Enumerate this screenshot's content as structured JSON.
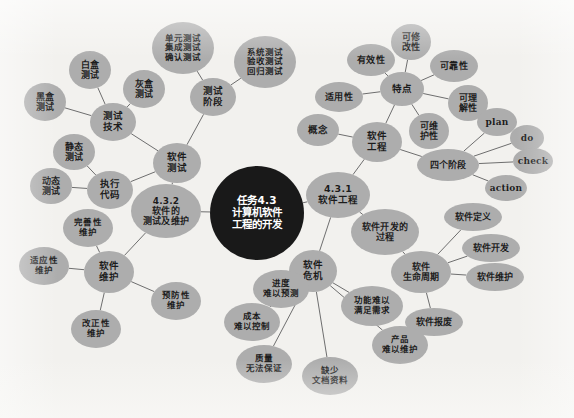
{
  "diagram": {
    "background_color": "#f2f1ee",
    "node_color": "#adadad",
    "center_node_color": "#191919",
    "edge_color": "#6e6e6e",
    "width": 574,
    "height": 418
  },
  "nodes": [
    {
      "id": "center",
      "label": "任务4.3\n计算机软件\n工程的开发",
      "x": 257,
      "y": 213,
      "rx": 47,
      "ry": 47,
      "font": 10.5,
      "kind": "center",
      "script": "cjk"
    },
    {
      "id": "n431",
      "label": "4.3.1\n软件工程",
      "x": 338,
      "y": 195,
      "rx": 32,
      "ry": 23,
      "font": 9.5,
      "kind": "branch",
      "script": "cjk"
    },
    {
      "id": "n432",
      "label": "4.3.2\n软件的\n测试及维护",
      "x": 166,
      "y": 211,
      "rx": 35,
      "ry": 27,
      "font": 9,
      "kind": "branch",
      "script": "cjk"
    },
    {
      "id": "ruanjiangongcheng",
      "label": "软件\n工程",
      "x": 377,
      "y": 142,
      "rx": 25,
      "ry": 20,
      "font": 9.5,
      "kind": "node",
      "script": "cjk"
    },
    {
      "id": "gainian",
      "label": "概念",
      "x": 318,
      "y": 130,
      "rx": 21,
      "ry": 16,
      "font": 9.5,
      "kind": "node",
      "script": "cjk"
    },
    {
      "id": "tedian",
      "label": "特点",
      "x": 402,
      "y": 89,
      "rx": 22,
      "ry": 17,
      "font": 9.5,
      "kind": "node",
      "script": "cjk"
    },
    {
      "id": "shiyongxing",
      "label": "适用性",
      "x": 339,
      "y": 97,
      "rx": 24,
      "ry": 15,
      "font": 9,
      "kind": "node",
      "script": "cjk"
    },
    {
      "id": "youxiaoxing",
      "label": "有效性",
      "x": 371,
      "y": 60,
      "rx": 24,
      "ry": 16,
      "font": 9,
      "kind": "node",
      "script": "cjk"
    },
    {
      "id": "kexiugaixing",
      "label": "可修\n改性",
      "x": 411,
      "y": 42,
      "rx": 20,
      "ry": 18,
      "font": 9,
      "kind": "node",
      "script": "cjk"
    },
    {
      "id": "kekaoxing",
      "label": "可靠性",
      "x": 454,
      "y": 66,
      "rx": 24,
      "ry": 16,
      "font": 9,
      "kind": "node",
      "script": "cjk"
    },
    {
      "id": "kelijiexing",
      "label": "可理\n解性",
      "x": 468,
      "y": 103,
      "rx": 20,
      "ry": 18,
      "font": 9,
      "kind": "node",
      "script": "cjk"
    },
    {
      "id": "keweihuxing",
      "label": "可维\n护性",
      "x": 429,
      "y": 131,
      "rx": 20,
      "ry": 18,
      "font": 9,
      "kind": "node",
      "script": "cjk"
    },
    {
      "id": "sigejieduan",
      "label": "四个阶段",
      "x": 448,
      "y": 165,
      "rx": 31,
      "ry": 16,
      "font": 9,
      "kind": "node",
      "script": "cjk"
    },
    {
      "id": "plan",
      "label": "plan",
      "x": 497,
      "y": 122,
      "rx": 20,
      "ry": 14,
      "font": 9,
      "kind": "node",
      "script": "latin"
    },
    {
      "id": "do",
      "label": "do",
      "x": 527,
      "y": 138,
      "rx": 17,
      "ry": 13,
      "font": 9,
      "kind": "node",
      "script": "latin"
    },
    {
      "id": "check",
      "label": "check",
      "x": 533,
      "y": 161,
      "rx": 20,
      "ry": 13,
      "font": 9,
      "kind": "node",
      "script": "latin"
    },
    {
      "id": "action",
      "label": "action",
      "x": 506,
      "y": 188,
      "rx": 21,
      "ry": 13,
      "font": 9,
      "kind": "node",
      "script": "latin"
    },
    {
      "id": "kaifaguocheng",
      "label": "软件开发的\n过程",
      "x": 385,
      "y": 232,
      "rx": 34,
      "ry": 23,
      "font": 9,
      "kind": "node",
      "script": "cjk"
    },
    {
      "id": "shengmingzhouqi",
      "label": "软件\n生命周期",
      "x": 421,
      "y": 272,
      "rx": 30,
      "ry": 21,
      "font": 9,
      "kind": "node",
      "script": "cjk"
    },
    {
      "id": "ruanjiandingyi",
      "label": "软件定义",
      "x": 473,
      "y": 217,
      "rx": 29,
      "ry": 14,
      "font": 9,
      "kind": "node",
      "script": "cjk"
    },
    {
      "id": "ruanjiankaifa",
      "label": "软件开发",
      "x": 491,
      "y": 248,
      "rx": 29,
      "ry": 14,
      "font": 9,
      "kind": "node",
      "script": "cjk"
    },
    {
      "id": "ruanjianweihu",
      "label": "软件维护",
      "x": 495,
      "y": 277,
      "rx": 29,
      "ry": 14,
      "font": 9,
      "kind": "node",
      "script": "cjk"
    },
    {
      "id": "ruanjianbaofei",
      "label": "软件报废",
      "x": 434,
      "y": 322,
      "rx": 29,
      "ry": 14,
      "font": 9,
      "kind": "node",
      "script": "cjk"
    },
    {
      "id": "weiji",
      "label": "软件\n危机",
      "x": 313,
      "y": 271,
      "rx": 24,
      "ry": 21,
      "font": 9.5,
      "kind": "node",
      "script": "cjk"
    },
    {
      "id": "jindu",
      "label": "进度\n难以预测",
      "x": 281,
      "y": 289,
      "rx": 28,
      "ry": 19,
      "font": 8.5,
      "kind": "node",
      "script": "cjk"
    },
    {
      "id": "chengben",
      "label": "成本\n难以控制",
      "x": 252,
      "y": 322,
      "rx": 28,
      "ry": 19,
      "font": 8.5,
      "kind": "node",
      "script": "cjk"
    },
    {
      "id": "zhiliang",
      "label": "质量\n无法保证",
      "x": 264,
      "y": 364,
      "rx": 28,
      "ry": 19,
      "font": 8.5,
      "kind": "node",
      "script": "cjk"
    },
    {
      "id": "quewen",
      "label": "缺少\n文档资料",
      "x": 330,
      "y": 376,
      "rx": 28,
      "ry": 19,
      "font": 8.5,
      "kind": "node",
      "script": "cjk"
    },
    {
      "id": "gongneng",
      "label": "功能难以\n满足需求",
      "x": 372,
      "y": 306,
      "rx": 31,
      "ry": 20,
      "font": 8.5,
      "kind": "node",
      "script": "cjk"
    },
    {
      "id": "chanpin",
      "label": "产品\n难以维护",
      "x": 400,
      "y": 345,
      "rx": 28,
      "ry": 19,
      "font": 8.5,
      "kind": "node",
      "script": "cjk"
    },
    {
      "id": "ruanjianceshi",
      "label": "软件\n测试",
      "x": 177,
      "y": 163,
      "rx": 24,
      "ry": 20,
      "font": 9.5,
      "kind": "node",
      "script": "cjk"
    },
    {
      "id": "ceshijishu",
      "label": "测试\n技术",
      "x": 113,
      "y": 122,
      "rx": 23,
      "ry": 19,
      "font": 9.5,
      "kind": "node",
      "script": "cjk"
    },
    {
      "id": "baihe",
      "label": "白盒\n测试",
      "x": 90,
      "y": 70,
      "rx": 21,
      "ry": 19,
      "font": 9,
      "kind": "node",
      "script": "cjk"
    },
    {
      "id": "heihe",
      "label": "黑盒\n测试",
      "x": 45,
      "y": 102,
      "rx": 21,
      "ry": 19,
      "font": 9,
      "kind": "node",
      "script": "cjk"
    },
    {
      "id": "huihe",
      "label": "灰盒\n测试",
      "x": 144,
      "y": 89,
      "rx": 21,
      "ry": 19,
      "font": 9,
      "kind": "node",
      "script": "cjk"
    },
    {
      "id": "ceshijieduan",
      "label": "测试\n阶段",
      "x": 213,
      "y": 97,
      "rx": 23,
      "ry": 19,
      "font": 9.5,
      "kind": "node",
      "script": "cjk"
    },
    {
      "id": "danyuan",
      "label": "单元测试\n集成测试\n确认测试",
      "x": 183,
      "y": 48,
      "rx": 31,
      "ry": 26,
      "font": 8.5,
      "kind": "node",
      "script": "cjk"
    },
    {
      "id": "xitong",
      "label": "系统测试\n验收测试\n回归测试",
      "x": 265,
      "y": 62,
      "rx": 31,
      "ry": 26,
      "font": 8.5,
      "kind": "node",
      "script": "cjk"
    },
    {
      "id": "zhixingdaima",
      "label": "执行\n代码",
      "x": 110,
      "y": 190,
      "rx": 23,
      "ry": 19,
      "font": 9.5,
      "kind": "node",
      "script": "cjk"
    },
    {
      "id": "jingtai",
      "label": "静态\n测试",
      "x": 74,
      "y": 152,
      "rx": 21,
      "ry": 18,
      "font": 9,
      "kind": "node",
      "script": "cjk"
    },
    {
      "id": "dongtai",
      "label": "动态\n测试",
      "x": 51,
      "y": 186,
      "rx": 21,
      "ry": 18,
      "font": 9,
      "kind": "node",
      "script": "cjk"
    },
    {
      "id": "ruanjianweihu2",
      "label": "软件\n维护",
      "x": 109,
      "y": 272,
      "rx": 25,
      "ry": 21,
      "font": 9.5,
      "kind": "node",
      "script": "cjk"
    },
    {
      "id": "wanshanxing",
      "label": "完善性\n维护",
      "x": 88,
      "y": 228,
      "rx": 25,
      "ry": 19,
      "font": 8.5,
      "kind": "node",
      "script": "cjk"
    },
    {
      "id": "shiyingxing",
      "label": "适应性\n维护",
      "x": 44,
      "y": 266,
      "rx": 25,
      "ry": 19,
      "font": 8.5,
      "kind": "node",
      "script": "cjk"
    },
    {
      "id": "gaizhengxing",
      "label": "改正性\n维护",
      "x": 96,
      "y": 329,
      "rx": 25,
      "ry": 19,
      "font": 8.5,
      "kind": "node",
      "script": "cjk"
    },
    {
      "id": "yufangxing",
      "label": "预防性\n维护",
      "x": 176,
      "y": 301,
      "rx": 25,
      "ry": 19,
      "font": 8.5,
      "kind": "node",
      "script": "cjk"
    }
  ],
  "edges": [
    [
      "center",
      "n431"
    ],
    [
      "center",
      "n432"
    ],
    [
      "n431",
      "ruanjiangongcheng"
    ],
    [
      "n431",
      "kaifaguocheng"
    ],
    [
      "n431",
      "weiji"
    ],
    [
      "ruanjiangongcheng",
      "gainian"
    ],
    [
      "ruanjiangongcheng",
      "tedian"
    ],
    [
      "ruanjiangongcheng",
      "sigejieduan"
    ],
    [
      "tedian",
      "shiyongxing"
    ],
    [
      "tedian",
      "youxiaoxing"
    ],
    [
      "tedian",
      "kexiugaixing"
    ],
    [
      "tedian",
      "kekaoxing"
    ],
    [
      "tedian",
      "kelijiexing"
    ],
    [
      "tedian",
      "keweihuxing"
    ],
    [
      "sigejieduan",
      "plan"
    ],
    [
      "sigejieduan",
      "do"
    ],
    [
      "sigejieduan",
      "check"
    ],
    [
      "sigejieduan",
      "action"
    ],
    [
      "kaifaguocheng",
      "shengmingzhouqi"
    ],
    [
      "shengmingzhouqi",
      "ruanjiandingyi"
    ],
    [
      "shengmingzhouqi",
      "ruanjiankaifa"
    ],
    [
      "shengmingzhouqi",
      "ruanjianweihu"
    ],
    [
      "shengmingzhouqi",
      "ruanjianbaofei"
    ],
    [
      "weiji",
      "jindu"
    ],
    [
      "weiji",
      "chengben"
    ],
    [
      "weiji",
      "zhiliang"
    ],
    [
      "weiji",
      "quewen"
    ],
    [
      "weiji",
      "gongneng"
    ],
    [
      "weiji",
      "chanpin"
    ],
    [
      "n432",
      "ruanjianceshi"
    ],
    [
      "n432",
      "ruanjianweihu2"
    ],
    [
      "ruanjianceshi",
      "ceshijishu"
    ],
    [
      "ruanjianceshi",
      "ceshijieduan"
    ],
    [
      "ruanjianceshi",
      "zhixingdaima"
    ],
    [
      "ceshijishu",
      "baihe"
    ],
    [
      "ceshijishu",
      "heihe"
    ],
    [
      "ceshijishu",
      "huihe"
    ],
    [
      "ceshijieduan",
      "danyuan"
    ],
    [
      "ceshijieduan",
      "xitong"
    ],
    [
      "zhixingdaima",
      "jingtai"
    ],
    [
      "zhixingdaima",
      "dongtai"
    ],
    [
      "ruanjianweihu2",
      "wanshanxing"
    ],
    [
      "ruanjianweihu2",
      "shiyingxing"
    ],
    [
      "ruanjianweihu2",
      "gaizhengxing"
    ],
    [
      "ruanjianweihu2",
      "yufangxing"
    ]
  ]
}
